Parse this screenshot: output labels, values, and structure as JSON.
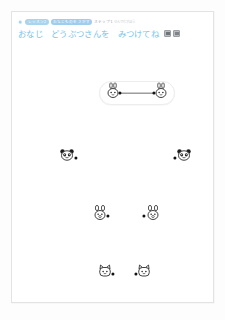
{
  "app": {
    "background": "#fdfdfd",
    "card_border": "#e3e3e3"
  },
  "breadcrumb": {
    "gear_icon": "gear-icon",
    "badges": [
      {
        "label": "レッスン2",
        "color": "#a8d4f0"
      },
      {
        "label": "おなじものをさがす",
        "color": "#9ecdee"
      }
    ],
    "step_label": "ステップ1",
    "trailing_label": "せんでむすぼう"
  },
  "title": {
    "text": "おなじ　どうぶつさんを　みつけてね",
    "color": "#79c3ea",
    "buttons": [
      {
        "name": "sound-button",
        "icon": "speaker-icon"
      },
      {
        "name": "help-button",
        "icon": "question-icon"
      }
    ]
  },
  "chart_data": {
    "type": "scatter",
    "title": "おなじ　どうぶつさんを　みつけてね",
    "xlabel": "",
    "ylabel": "",
    "grid": false,
    "pairs": [
      {
        "animal": "rabbit",
        "connected": true,
        "highlighted": true,
        "left": {
          "x": 101,
          "y": 53,
          "dot_x": 108,
          "dot_y": 53
        },
        "right": {
          "x": 149,
          "y": 53,
          "dot_x": 142,
          "dot_y": 53
        }
      },
      {
        "animal": "panda",
        "connected": false,
        "highlighted": false,
        "left": {
          "x": 55,
          "y": 117,
          "dot_x": 64,
          "dot_y": 118
        },
        "right": {
          "x": 172,
          "y": 117,
          "dot_x": 163,
          "dot_y": 118
        }
      },
      {
        "animal": "bear",
        "connected": false,
        "highlighted": false,
        "left": {
          "x": 88,
          "y": 175,
          "dot_x": 96,
          "dot_y": 176
        },
        "right": {
          "x": 141,
          "y": 175,
          "dot_x": 132,
          "dot_y": 176
        }
      },
      {
        "animal": "cat",
        "connected": false,
        "highlighted": false,
        "left": {
          "x": 93,
          "y": 233,
          "dot_x": 101,
          "dot_y": 234
        },
        "right": {
          "x": 132,
          "y": 233,
          "dot_x": 124,
          "dot_y": 234
        }
      }
    ]
  }
}
